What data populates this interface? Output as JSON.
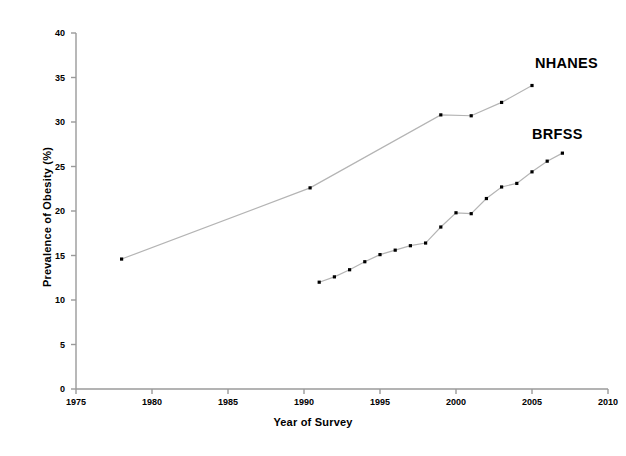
{
  "chart_data": {
    "type": "line",
    "title": "",
    "xlabel": "Year of Survey",
    "ylabel": "Prevalence of Obesity (%)",
    "xlim": [
      1975,
      2010
    ],
    "ylim": [
      0,
      40
    ],
    "xticks": [
      1975,
      1980,
      1985,
      1990,
      1995,
      2000,
      2005,
      2010
    ],
    "yticks": [
      0,
      5,
      10,
      15,
      20,
      25,
      30,
      35,
      40
    ],
    "grid": false,
    "legend_position": "inline-right-of-series",
    "marker": "square",
    "marker_color": "#000000",
    "line_color": "#b4b4b4",
    "series": [
      {
        "name": "NHANES",
        "label_x": 2005.2,
        "label_y": 36.4,
        "points": [
          {
            "x": 1978.0,
            "y": 14.6
          },
          {
            "x": 1990.4,
            "y": 22.6
          },
          {
            "x": 1999.0,
            "y": 30.8
          },
          {
            "x": 2001.0,
            "y": 30.7
          },
          {
            "x": 2003.0,
            "y": 32.2
          },
          {
            "x": 2005.0,
            "y": 34.1
          }
        ]
      },
      {
        "name": "BRFSS",
        "label_x": 2005.0,
        "label_y": 28.4,
        "points": [
          {
            "x": 1991.0,
            "y": 12.0
          },
          {
            "x": 1992.0,
            "y": 12.6
          },
          {
            "x": 1993.0,
            "y": 13.4
          },
          {
            "x": 1994.0,
            "y": 14.3
          },
          {
            "x": 1995.0,
            "y": 15.1
          },
          {
            "x": 1996.0,
            "y": 15.6
          },
          {
            "x": 1997.0,
            "y": 16.1
          },
          {
            "x": 1998.0,
            "y": 16.4
          },
          {
            "x": 1999.0,
            "y": 18.2
          },
          {
            "x": 2000.0,
            "y": 19.8
          },
          {
            "x": 2001.0,
            "y": 19.7
          },
          {
            "x": 2002.0,
            "y": 21.4
          },
          {
            "x": 2003.0,
            "y": 22.7
          },
          {
            "x": 2004.0,
            "y": 23.1
          },
          {
            "x": 2005.0,
            "y": 24.4
          },
          {
            "x": 2006.0,
            "y": 25.6
          },
          {
            "x": 2007.0,
            "y": 26.5
          }
        ]
      }
    ]
  },
  "axes": {
    "x_title": "Year of Survey",
    "y_title": "Prevalence of Obesity (%)",
    "x_tick_labels": [
      "1975",
      "1980",
      "1985",
      "1990",
      "1995",
      "2000",
      "2005",
      "2010"
    ],
    "y_tick_labels": [
      "0",
      "5",
      "10",
      "15",
      "20",
      "25",
      "30",
      "35",
      "40"
    ]
  },
  "series_labels": {
    "nhanes": "NHANES",
    "brfss": "BRFSS"
  }
}
